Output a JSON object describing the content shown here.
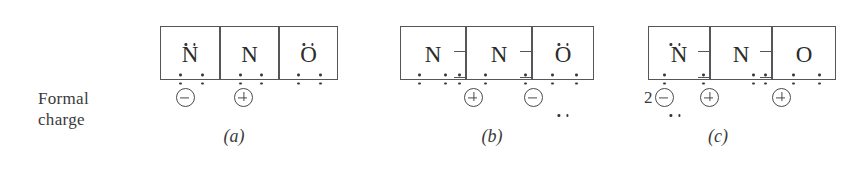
{
  "figure": {
    "kind": "lewis-structure-resonance-diagram",
    "formal_charge_label": {
      "line1": "Formal",
      "line2": "charge"
    },
    "charge_glyphs": {
      "negative": "circled-minus",
      "positive": "circled-plus"
    },
    "structures": [
      {
        "id": "a",
        "caption": "(a)",
        "left": 160,
        "boxes_left": 160,
        "atoms": [
          {
            "symbol": "N",
            "box_left": 0,
            "box_width": 60,
            "lone_pairs": [
              "top",
              "left",
              "right"
            ],
            "notches": []
          },
          {
            "symbol": "N",
            "box_left": 60,
            "box_width": 59,
            "lone_pairs": [
              "left",
              "right"
            ],
            "notches": []
          },
          {
            "symbol": "O",
            "box_left": 119,
            "box_width": 59,
            "lone_pairs": [
              "top",
              "left",
              "right"
            ],
            "notches": []
          }
        ],
        "charges": [
          {
            "left": 14,
            "multiplier": "",
            "sign": "minus"
          },
          {
            "left": 72,
            "multiplier": "",
            "sign": "plus"
          }
        ]
      },
      {
        "id": "b",
        "caption": "(b)",
        "left": 400,
        "boxes_left": 400,
        "atoms": [
          {
            "symbol": "N",
            "box_left": 0,
            "box_width": 66,
            "lone_pairs": [
              "left",
              "right"
            ],
            "notches": [
              "right-top-out"
            ]
          },
          {
            "symbol": "N",
            "box_left": 66,
            "box_width": 66,
            "lone_pairs": [
              "left"
            ],
            "notches": [
              "right-top-out"
            ]
          },
          {
            "symbol": "O",
            "box_left": 132,
            "box_width": 62,
            "lone_pairs": [
              "top",
              "bottom",
              "left",
              "right"
            ],
            "notches": []
          }
        ],
        "charges": [
          {
            "left": 62,
            "multiplier": "",
            "sign": "plus"
          },
          {
            "left": 122,
            "multiplier": "",
            "sign": "minus"
          }
        ]
      },
      {
        "id": "c",
        "caption": "(c)",
        "left": 648,
        "boxes_left": 648,
        "atoms": [
          {
            "symbol": "N",
            "box_left": 0,
            "box_width": 62,
            "lone_pairs": [
              "top",
              "bottom",
              "left"
            ],
            "notches": [
              "right-top-out"
            ]
          },
          {
            "symbol": "N",
            "box_left": 62,
            "box_width": 62,
            "lone_pairs": [
              "right"
            ],
            "notches": [
              "right-top-out"
            ]
          },
          {
            "symbol": "O",
            "box_left": 124,
            "box_width": 64,
            "lone_pairs": [
              "left",
              "right"
            ],
            "notches": []
          }
        ],
        "charges": [
          {
            "left": -4,
            "multiplier": "2",
            "sign": "minus"
          },
          {
            "left": 50,
            "multiplier": "",
            "sign": "plus"
          },
          {
            "left": 122,
            "multiplier": "",
            "sign": "plus"
          }
        ]
      }
    ]
  }
}
